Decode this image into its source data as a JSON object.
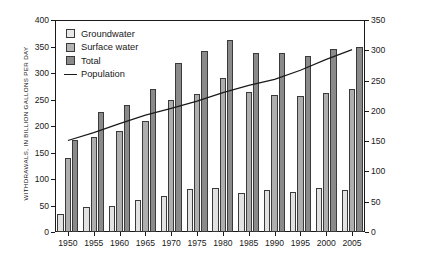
{
  "chart_data": {
    "type": "bar",
    "title": "",
    "xlabel": "",
    "ylabel": "WITHDRAWALS, IN BILLION GALLONS PER DAY",
    "y2label": "POPULATION, IN MILLIONS",
    "categories": [
      "1950",
      "1955",
      "1960",
      "1965",
      "1970",
      "1975",
      "1980",
      "1985",
      "1990",
      "1995",
      "2000",
      "2005"
    ],
    "ylim": [
      0,
      400
    ],
    "yticks": [
      0,
      50,
      100,
      150,
      200,
      250,
      300,
      350,
      400
    ],
    "y2lim": [
      0,
      350
    ],
    "y2ticks": [
      0,
      50,
      100,
      150,
      200,
      250,
      300,
      350
    ],
    "grid": false,
    "legend_position": "upper-left",
    "series": [
      {
        "name": "Groundwater",
        "type": "bar",
        "axis": "left",
        "color": "#e2e2e2",
        "values": [
          34,
          47,
          50,
          60,
          68,
          82,
          83,
          73,
          79,
          76,
          83,
          79
        ]
      },
      {
        "name": "Surface water",
        "type": "bar",
        "axis": "left",
        "color": "#aeaeae",
        "values": [
          140,
          180,
          190,
          210,
          250,
          260,
          290,
          265,
          259,
          256,
          262,
          270
        ]
      },
      {
        "name": "Total",
        "type": "bar",
        "axis": "left",
        "color": "#8a8a8a",
        "values": [
          174,
          227,
          240,
          270,
          318,
          342,
          362,
          338,
          338,
          332,
          345,
          349
        ]
      },
      {
        "name": "Population",
        "type": "line",
        "axis": "right",
        "color": "#1a1a1a",
        "values": [
          151,
          164,
          179,
          193,
          204,
          216,
          230,
          242,
          252,
          267,
          285,
          301
        ]
      }
    ]
  },
  "legend": {
    "items": [
      {
        "label": "Groundwater",
        "marker": "swatch-light"
      },
      {
        "label": "Surface water",
        "marker": "swatch-medium"
      },
      {
        "label": "Total",
        "marker": "swatch-dark"
      },
      {
        "label": "Population",
        "marker": "line"
      }
    ]
  }
}
